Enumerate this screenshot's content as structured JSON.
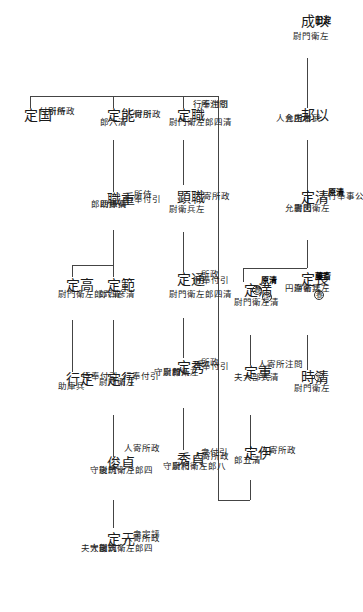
{
  "nodes": [
    {
      "id": "mochinari",
      "name": "以成",
      "clan": "淀田",
      "notes": [
        "左衛門尉"
      ]
    },
    {
      "id": "mochikuni",
      "name": "以邦",
      "notes": [
        "武者所",
        "木工允",
        "内舎人"
      ]
    },
    {
      "id": "kiyosada",
      "name": "清定",
      "clan": "清原",
      "notes": [
        "公事奉行人",
        "左衛門尉",
        "図書允"
      ]
    },
    {
      "id": "nagasada",
      "name": "長定",
      "clan": "斎藤",
      "mark": "養",
      "notes": [
        "左兵衛尉",
        "法名浄円"
      ]
    },
    {
      "id": "kiyotoki",
      "name": "清時",
      "mark": "①",
      "notes": [
        "左衛門尉"
      ]
    },
    {
      "id": "mitsusada",
      "name": "満定",
      "clan": "清原",
      "mark": "養",
      "mark2": "①",
      "notes": [
        "清左衛門尉"
      ]
    },
    {
      "id": "shigesada",
      "name": "重定",
      "notes": [
        "問注所寄人",
        "清式部大夫"
      ]
    },
    {
      "id": "iesada",
      "name": "伊定",
      "notes": [
        "政所寄人",
        "清五郎"
      ]
    },
    {
      "id": "motosada_s",
      "name": "職定",
      "notes": [
        "問注所",
        "引付奉行",
        "清四郎左衛門尉"
      ]
    },
    {
      "id": "motoaki",
      "name": "職顕",
      "notes": [
        "政所寄人",
        "左兵衛尉"
      ]
    },
    {
      "id": "michisada",
      "name": "通定",
      "notes": [
        "政所",
        "引付奉行",
        "清四郎左衛門尉"
      ]
    },
    {
      "id": "hidesada",
      "name": "秀定",
      "notes": [
        "政所",
        "引付奉行",
        "八郎",
        "左衛門尉",
        "和泉守"
      ]
    },
    {
      "id": "sadahide",
      "name": "貞秀",
      "notes": [
        "引付衆",
        "政所寄人",
        "八郎左衛門尉",
        "和泉守"
      ]
    },
    {
      "id": "kunisada",
      "name": "国定",
      "notes": [
        "政所",
        "侍所",
        "引付"
      ]
    },
    {
      "id": "yoshisada",
      "name": "能定",
      "notes": [
        "引付",
        "政所寄人",
        "清六郎"
      ]
    },
    {
      "id": "shigemoto",
      "name": "重職",
      "notes": [
        "侍所",
        "引付奉行",
        "兵庫助",
        "清孫四郎"
      ]
    },
    {
      "id": "takasada",
      "name": "高定",
      "notes": [
        "清六郎左衛門尉"
      ]
    },
    {
      "id": "norisada",
      "name": "範定",
      "notes": [
        "清彦四郎"
      ]
    },
    {
      "id": "sadayuki",
      "name": "定行",
      "notes": [
        "引付奉行",
        "兵庫助"
      ]
    },
    {
      "id": "yukisada",
      "name": "行定",
      "notes": [
        "引付奉行",
        "左衛門尉"
      ]
    },
    {
      "id": "sadatoshi",
      "name": "貞俊",
      "notes": [
        "政所寄人",
        "四郎左衛門尉",
        "筑後守"
      ]
    },
    {
      "id": "motosada",
      "name": "元定",
      "notes": [
        "評定衆",
        "政所寄人",
        "四郎左衛門尉",
        "筑後守",
        "式部大夫"
      ]
    }
  ]
}
